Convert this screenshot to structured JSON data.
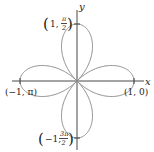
{
  "figure": {
    "type": "polar-rose-plot",
    "equation_hint": "four-petal rose",
    "axes": {
      "x_label": "x",
      "y_label": "y"
    },
    "annotations": {
      "right": "(1, 0)",
      "left": "(−1, π)",
      "top_prefix": "1,",
      "top_num": "π",
      "top_den": "2",
      "bottom_prefix": "−1,",
      "bottom_num": "3π",
      "bottom_den": "2"
    },
    "colors": {
      "curve": "#8a8a8a",
      "axes": "#333333"
    }
  },
  "geometry": {
    "origin": [
      77,
      81
    ],
    "radius": 57,
    "petals": 4
  }
}
